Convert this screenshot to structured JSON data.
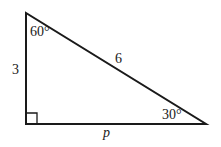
{
  "diagram": {
    "type": "right-triangle",
    "vertices": {
      "top": [
        26,
        13
      ],
      "right_angle": [
        26,
        124
      ],
      "bottom_right": [
        206,
        124
      ]
    },
    "labels": {
      "angle_top": "60°",
      "angle_bottom_right": "30°",
      "side_left": "3",
      "hypotenuse": "6",
      "side_bottom": "p"
    },
    "colors": {
      "stroke": "#1a1a1a",
      "background": "#ffffff"
    }
  }
}
